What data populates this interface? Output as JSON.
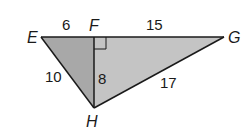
{
  "figure": {
    "vertices": {
      "E": {
        "label": "E",
        "x": 41,
        "y": 37
      },
      "F": {
        "label": "F",
        "x": 94,
        "y": 37
      },
      "G": {
        "label": "G",
        "x": 224,
        "y": 37
      },
      "H": {
        "label": "H",
        "x": 94,
        "y": 108
      }
    },
    "segments": [
      {
        "name": "EF",
        "length": "6"
      },
      {
        "name": "FG",
        "length": "15"
      },
      {
        "name": "EH",
        "length": "10"
      },
      {
        "name": "FH",
        "length": "8"
      },
      {
        "name": "GH",
        "length": "17"
      }
    ],
    "right_angle_at": "F",
    "colors": {
      "left_triangle_fill": "#a8a8a8",
      "right_triangle_fill": "#c4c4c4",
      "stroke": "#1a1a1a"
    }
  }
}
